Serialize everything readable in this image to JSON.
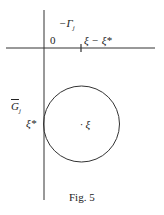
{
  "figure": {
    "caption": "Fig. 5",
    "labels": {
      "origin": "0",
      "gamma": "−Γ",
      "gamma_sub": "j",
      "shift": "ξ − ξ*",
      "g_bar": "G",
      "g_sub": "j",
      "xi_star": "ξ*",
      "center": "· ξ"
    },
    "geometry": {
      "v_axis_x": 44,
      "h_axis_y": 48,
      "tick_x": 81,
      "circle": {
        "cx": 81.5,
        "cy": 124,
        "r": 38
      }
    },
    "colors": {
      "ink": "#222222",
      "background": "#ffffff"
    }
  }
}
